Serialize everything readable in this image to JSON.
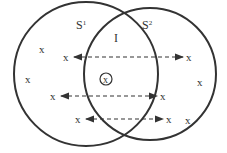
{
  "diagram": {
    "sets": [
      {
        "label": "S",
        "superscript": "1",
        "cx": 86,
        "cy": 74,
        "r": 72
      },
      {
        "label": "S",
        "superscript": "2",
        "cx": 150,
        "cy": 74,
        "r": 66
      }
    ],
    "intersection_label": "I",
    "point_marker": "x",
    "points": [
      {
        "x": 42,
        "y": 49
      },
      {
        "x": 28,
        "y": 79
      },
      {
        "x": 200,
        "y": 82
      },
      {
        "x": 188,
        "y": 120
      }
    ],
    "circled_point": {
      "x": 106,
      "y": 79
    },
    "arrows": [
      {
        "x1": 67,
        "x2": 190,
        "y": 57
      },
      {
        "x1": 54,
        "x2": 164,
        "y": 96
      },
      {
        "x1": 79,
        "x2": 170,
        "y": 119
      }
    ],
    "colors": {
      "stroke": "#333333",
      "background": "#ffffff"
    }
  }
}
